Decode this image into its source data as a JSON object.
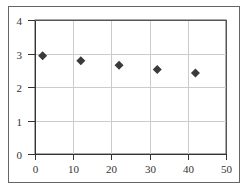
{
  "chart_data": {
    "type": "scatter",
    "title": "",
    "xlabel": "",
    "ylabel": "",
    "xlim": [
      0,
      50
    ],
    "ylim": [
      0,
      4
    ],
    "xticks": [
      0,
      10,
      20,
      30,
      40,
      50
    ],
    "yticks": [
      0,
      1,
      2,
      3,
      4
    ],
    "xtick_labels": [
      "0",
      "10",
      "20",
      "30",
      "40",
      "50"
    ],
    "ytick_labels": [
      "0",
      "1",
      "2",
      "3",
      "4"
    ],
    "grid": true,
    "legend": "none",
    "marker": "diamond",
    "series": [
      {
        "name": "series-1",
        "color": "#3a3a3a",
        "x": [
          2,
          12,
          22,
          32,
          42
        ],
        "y": [
          2.93,
          2.78,
          2.65,
          2.52,
          2.42
        ]
      }
    ]
  },
  "colors": {
    "frame": "#555555",
    "grid": "#cccccc",
    "axis": "#333333",
    "marker": "#3a3a3a"
  }
}
